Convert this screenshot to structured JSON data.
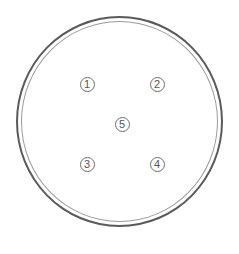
{
  "diagram": {
    "type": "petri-dish",
    "colors": {
      "outer_ring": "#5a5a5a",
      "inner_ring": "#9a9a9a",
      "marker_border": "#6e6e6e",
      "marker_text": "#555555",
      "background": "#ffffff"
    },
    "markers": [
      {
        "label": "1",
        "x": 87,
        "y": 84
      },
      {
        "label": "2",
        "x": 157,
        "y": 84
      },
      {
        "label": "5",
        "x": 122,
        "y": 124
      },
      {
        "label": "3",
        "x": 87,
        "y": 164
      },
      {
        "label": "4",
        "x": 157,
        "y": 164
      }
    ]
  }
}
